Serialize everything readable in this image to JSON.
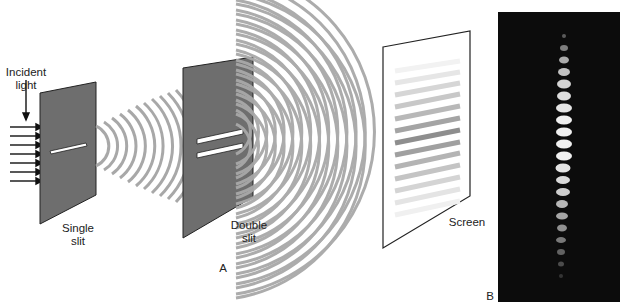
{
  "panel_a": {
    "label": "A",
    "incident_light": {
      "line1": "Incident",
      "line2": "light"
    },
    "single_slit": {
      "line1": "Single",
      "line2": "slit"
    },
    "double_slit": {
      "line1": "Double",
      "line2": "slit"
    },
    "screen": {
      "label": "Screen"
    },
    "arrow_count": 7,
    "colors": {
      "barrier": "#6e6e6e",
      "wave": "#a8a8a8",
      "screen": "#ffffff",
      "outline": "#222222"
    }
  },
  "panel_b": {
    "label": "B",
    "fringe_count": 20,
    "colors": {
      "background": "#0c0c0c",
      "fringe": "#f0f0f0"
    }
  }
}
